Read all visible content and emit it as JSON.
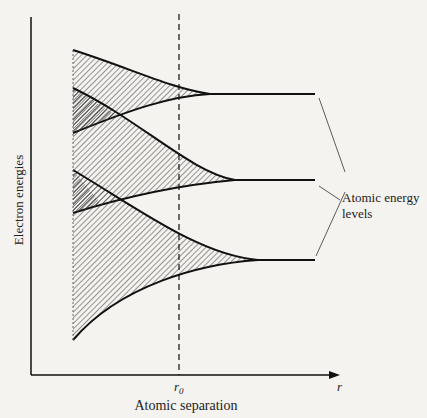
{
  "diagram": {
    "type": "energy-band-diagram",
    "ylabel": "Electron energies",
    "xlabel": "Atomic separation",
    "x_tick_r0": "r",
    "x_tick_r0_sub": "0",
    "x_axis_end": "r",
    "annotation_line1": "Atomic energy",
    "annotation_line2": "levels",
    "bands": [
      {
        "name": "band-1",
        "level_y": 94
      },
      {
        "name": "band-2",
        "level_y": 180
      },
      {
        "name": "band-3",
        "level_y": 260
      }
    ],
    "colors": {
      "ink": "#1a1a1a",
      "background": "#f4f3f0"
    }
  }
}
